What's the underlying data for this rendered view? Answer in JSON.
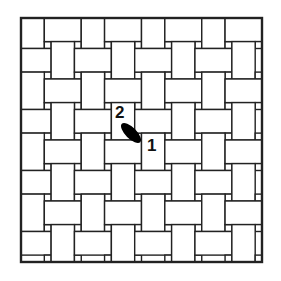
{
  "diagram": {
    "type": "basketweave-tile-pattern",
    "grid": {
      "columns": 8,
      "rows": 8
    },
    "frame": {
      "x": 21,
      "y": 18,
      "width": 241,
      "height": 244
    },
    "big_fraction": 0.774,
    "colors": {
      "line": "#222222",
      "fill": "#ffffff",
      "marker": "#000000"
    },
    "markers": [
      {
        "id": "start",
        "label": "1",
        "x": 147,
        "y": 137
      },
      {
        "id": "end",
        "label": "2",
        "x": 115,
        "y": 104
      }
    ],
    "pointer": {
      "cx": 131,
      "cy": 133,
      "rx": 13,
      "ry": 5.5,
      "angle": 45
    }
  }
}
